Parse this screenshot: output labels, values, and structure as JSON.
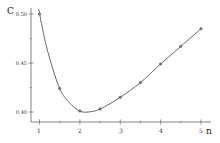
{
  "chart_data": {
    "type": "line",
    "title": "",
    "xlabel": "n",
    "ylabel": "C",
    "xlim": [
      0.8,
      5.2
    ],
    "ylim": [
      0.39,
      0.51
    ],
    "grid": false,
    "legend": null,
    "x_ticks": [
      1,
      2,
      3,
      4,
      5
    ],
    "x_tick_labels": [
      "1",
      "2",
      "3",
      "4",
      "5"
    ],
    "y_ticks": [
      0.4,
      0.45,
      0.5
    ],
    "y_tick_labels": [
      "0.40",
      "0.45",
      "0.50"
    ],
    "series": [
      {
        "name": "C(n)",
        "style": "smooth line with circle markers",
        "color": "#555555",
        "markers": {
          "x": [
            1.0,
            1.5,
            2.0,
            2.5,
            3.0,
            3.5,
            4.0,
            4.5,
            5.0
          ],
          "y": [
            0.5,
            0.424,
            0.401,
            0.403,
            0.415,
            0.43,
            0.449,
            0.467,
            0.485
          ]
        },
        "curve": {
          "x": [
            0.98,
            1.1,
            1.25,
            1.5,
            1.75,
            2.0,
            2.2,
            2.5,
            3.0,
            3.5,
            4.0,
            4.5,
            5.0
          ],
          "y": [
            0.505,
            0.48,
            0.455,
            0.424,
            0.409,
            0.401,
            0.4,
            0.403,
            0.415,
            0.43,
            0.449,
            0.467,
            0.485
          ]
        }
      }
    ]
  },
  "labels": {
    "y_axis_title": "C",
    "x_axis_title": "n",
    "y_ticks": [
      "0.50",
      "0.45",
      "0.40"
    ],
    "x_ticks": [
      "1",
      "2",
      "3",
      "4",
      "5"
    ]
  },
  "colors": {
    "axis": "#666666",
    "line": "#555555",
    "marker": "#777777"
  }
}
